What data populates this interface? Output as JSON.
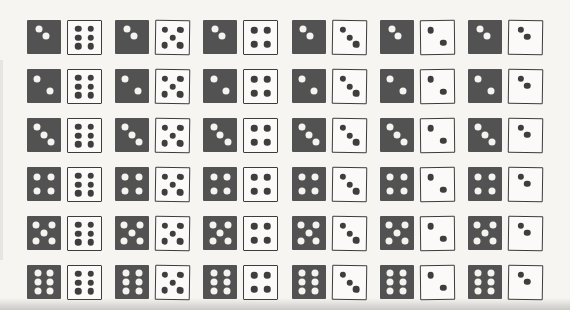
{
  "figure": {
    "rows": 6,
    "pairs_per_row": 6
  },
  "palette": {
    "background": "#f6f5f2",
    "dark_die_fill": "#525252",
    "dark_die_pip": "#f4f3f0",
    "white_die_fill": "#fbfaf8",
    "white_die_border": "#3c3c3c",
    "white_die_pip": "#3e3e3e"
  },
  "grid": {
    "white_column_values": [
      6,
      5,
      4,
      3,
      2,
      2
    ],
    "white_column_arrangements": [
      "standard",
      "standard",
      "standard",
      "standard",
      "standard",
      "compact"
    ],
    "rows_data": [
      {
        "dark": {
          "pips": 2,
          "arrangement": "compact"
        },
        "whites": [
          {
            "pips": 6,
            "arrangement": "standard"
          },
          {
            "pips": 5,
            "arrangement": "standard"
          },
          {
            "pips": 4,
            "arrangement": "standard"
          },
          {
            "pips": 3,
            "arrangement": "standard"
          },
          {
            "pips": 2,
            "arrangement": "standard"
          },
          {
            "pips": 2,
            "arrangement": "compact"
          }
        ]
      },
      {
        "dark": {
          "pips": 2,
          "arrangement": "standard"
        },
        "whites": [
          {
            "pips": 6,
            "arrangement": "standard"
          },
          {
            "pips": 5,
            "arrangement": "standard"
          },
          {
            "pips": 4,
            "arrangement": "standard"
          },
          {
            "pips": 3,
            "arrangement": "standard"
          },
          {
            "pips": 2,
            "arrangement": "standard"
          },
          {
            "pips": 2,
            "arrangement": "compact"
          }
        ]
      },
      {
        "dark": {
          "pips": 3,
          "arrangement": "standard"
        },
        "whites": [
          {
            "pips": 6,
            "arrangement": "standard"
          },
          {
            "pips": 5,
            "arrangement": "standard"
          },
          {
            "pips": 4,
            "arrangement": "standard"
          },
          {
            "pips": 3,
            "arrangement": "standard"
          },
          {
            "pips": 2,
            "arrangement": "standard"
          },
          {
            "pips": 2,
            "arrangement": "compact"
          }
        ]
      },
      {
        "dark": {
          "pips": 4,
          "arrangement": "standard"
        },
        "whites": [
          {
            "pips": 6,
            "arrangement": "standard"
          },
          {
            "pips": 5,
            "arrangement": "standard"
          },
          {
            "pips": 4,
            "arrangement": "standard"
          },
          {
            "pips": 3,
            "arrangement": "standard"
          },
          {
            "pips": 2,
            "arrangement": "standard"
          },
          {
            "pips": 2,
            "arrangement": "compact"
          }
        ]
      },
      {
        "dark": {
          "pips": 5,
          "arrangement": "standard"
        },
        "whites": [
          {
            "pips": 6,
            "arrangement": "standard"
          },
          {
            "pips": 5,
            "arrangement": "standard"
          },
          {
            "pips": 4,
            "arrangement": "standard"
          },
          {
            "pips": 3,
            "arrangement": "standard"
          },
          {
            "pips": 2,
            "arrangement": "standard"
          },
          {
            "pips": 2,
            "arrangement": "compact"
          }
        ]
      },
      {
        "dark": {
          "pips": 6,
          "arrangement": "standard"
        },
        "whites": [
          {
            "pips": 6,
            "arrangement": "standard"
          },
          {
            "pips": 5,
            "arrangement": "standard"
          },
          {
            "pips": 4,
            "arrangement": "standard"
          },
          {
            "pips": 3,
            "arrangement": "standard"
          },
          {
            "pips": 2,
            "arrangement": "standard"
          },
          {
            "pips": 2,
            "arrangement": "compact"
          }
        ]
      }
    ]
  }
}
